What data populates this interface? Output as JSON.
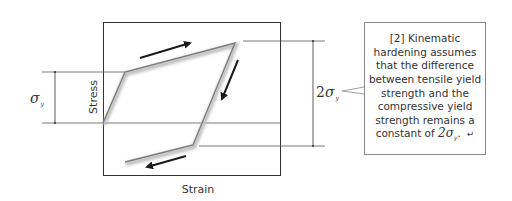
{
  "diagram": {
    "axes": {
      "x_label": "Strain",
      "y_label": "Stress"
    },
    "left_dimension": {
      "symbol": "σ",
      "subscript": "y"
    },
    "right_dimension": {
      "prefix": "2",
      "symbol": "σ",
      "subscript": "y"
    },
    "callout": {
      "ref": "[2]",
      "lines": [
        "[2] Kinematic",
        "hardening assumes",
        "that the difference",
        "between tensile yield",
        "strength and the",
        "compressive yield",
        "strength remains a"
      ],
      "last_line_prefix": "constant of ",
      "last_line_value": "2σ",
      "last_line_subscript": "y",
      "last_line_suffix": ".",
      "return_symbol": "↵"
    },
    "colors": {
      "curve": "#7a7a7a",
      "arrows": "#1a1a1a",
      "frame": "#333333",
      "guide_lines": "#555555"
    }
  }
}
